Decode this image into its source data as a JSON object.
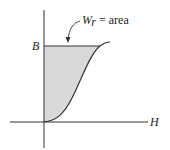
{
  "diagram": {
    "type": "BH magnetization curve with shaded energy area",
    "axes": {
      "x_label": "H",
      "y_label": "B"
    },
    "annotation": {
      "symbol": "W",
      "subscript": "r",
      "equals_text": " = area"
    },
    "colors": {
      "shade": "#d9d9d9",
      "line": "#333333"
    }
  }
}
